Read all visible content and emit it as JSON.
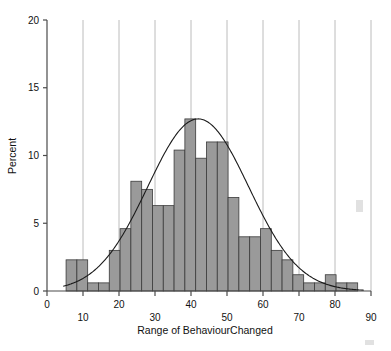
{
  "chart_data": {
    "type": "bar",
    "title": "",
    "subtitle": "",
    "xlabel": "Range of BehaviourChanged",
    "ylabel": "Percent",
    "xlim": [
      0,
      90
    ],
    "ylim": [
      0,
      20
    ],
    "grid": "vertical",
    "legend": "none",
    "xticks": [
      0,
      10,
      20,
      30,
      40,
      50,
      60,
      70,
      80,
      90
    ],
    "xtick_labels": [
      "0",
      "10",
      "20",
      "30",
      "40",
      "50",
      "60",
      "70",
      "80",
      "90"
    ],
    "xtick_rows": [
      0,
      1,
      0,
      1,
      0,
      1,
      0,
      1,
      0,
      1
    ],
    "yticks": [
      0,
      5,
      10,
      15,
      20
    ],
    "ytick_labels": [
      "0",
      "5",
      "10",
      "15",
      "20"
    ],
    "bin_width": 3,
    "bin_start": 5.3,
    "bar_color": "#9a9a9a",
    "bar_edge_color": "#3a3a3a",
    "curve_color": "#1a1a1a",
    "axis_color": "#4a4a4a",
    "grid_color": "#b4b4b4",
    "bins": [
      {
        "x0": 5.3,
        "x1": 8.3,
        "value": 2.3
      },
      {
        "x0": 8.3,
        "x1": 11.3,
        "value": 2.3
      },
      {
        "x0": 11.3,
        "x1": 14.3,
        "value": 0.6
      },
      {
        "x0": 14.3,
        "x1": 17.3,
        "value": 0.6
      },
      {
        "x0": 17.3,
        "x1": 20.3,
        "value": 3.0
      },
      {
        "x0": 20.3,
        "x1": 23.3,
        "value": 4.6
      },
      {
        "x0": 23.3,
        "x1": 26.3,
        "value": 8.1
      },
      {
        "x0": 26.3,
        "x1": 29.3,
        "value": 7.5
      },
      {
        "x0": 29.3,
        "x1": 32.3,
        "value": 6.3
      },
      {
        "x0": 32.3,
        "x1": 35.3,
        "value": 6.3
      },
      {
        "x0": 35.3,
        "x1": 38.3,
        "value": 10.4
      },
      {
        "x0": 38.3,
        "x1": 41.3,
        "value": 12.7
      },
      {
        "x0": 41.3,
        "x1": 44.3,
        "value": 9.8
      },
      {
        "x0": 44.3,
        "x1": 47.3,
        "value": 11.0
      },
      {
        "x0": 47.3,
        "x1": 50.3,
        "value": 11.0
      },
      {
        "x0": 50.3,
        "x1": 53.3,
        "value": 6.9
      },
      {
        "x0": 53.3,
        "x1": 56.3,
        "value": 4.0
      },
      {
        "x0": 56.3,
        "x1": 59.3,
        "value": 4.0
      },
      {
        "x0": 59.3,
        "x1": 62.3,
        "value": 4.6
      },
      {
        "x0": 62.3,
        "x1": 65.3,
        "value": 3.0
      },
      {
        "x0": 65.3,
        "x1": 68.3,
        "value": 2.3
      },
      {
        "x0": 68.3,
        "x1": 71.3,
        "value": 1.2
      },
      {
        "x0": 71.3,
        "x1": 74.3,
        "value": 0.6
      },
      {
        "x0": 74.3,
        "x1": 77.3,
        "value": 0.6
      },
      {
        "x0": 77.3,
        "x1": 80.3,
        "value": 1.2
      },
      {
        "x0": 80.3,
        "x1": 83.3,
        "value": 0.6
      },
      {
        "x0": 83.3,
        "x1": 86.3,
        "value": 0.6
      }
    ],
    "normal_curve": {
      "mean": 42.0,
      "std": 14.0,
      "peak": 12.7,
      "x_start": 4.5,
      "x_end": 88.0,
      "description": "fitted normal density overlay"
    }
  }
}
